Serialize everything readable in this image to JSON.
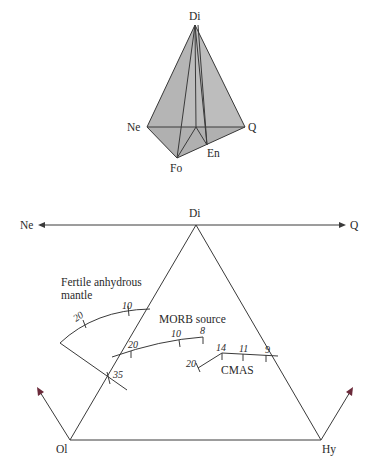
{
  "tetrahedron": {
    "vertices": {
      "di": "Di",
      "ne": "Ne",
      "q": "Q",
      "fo": "Fo",
      "en": "En"
    },
    "face_color": "#b9b9b9"
  },
  "triangle": {
    "top_axis": {
      "left": "Ne",
      "center": "Di",
      "right": "Q"
    },
    "vertices": {
      "ol": "Ol",
      "hy": "Hy"
    },
    "arrow_color": "#6b2a3a"
  },
  "labels": {
    "fertile_line1": "Fertile anhydrous",
    "fertile_line2": "mantle",
    "morb": "MORB source",
    "cmas": "CMAS"
  },
  "ticks": {
    "fertile": [
      "20",
      "10",
      "35"
    ],
    "morb": [
      "20",
      "10",
      "8"
    ],
    "cmas": [
      "20",
      "14",
      "11",
      "9"
    ]
  }
}
